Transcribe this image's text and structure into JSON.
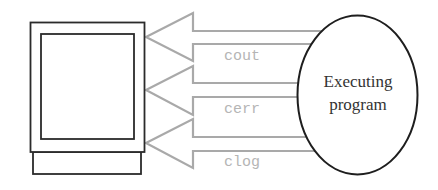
{
  "diagram": {
    "type": "stream-flow",
    "program": {
      "line1": "Executing",
      "line2": "program"
    },
    "display": {
      "label": "monitor"
    },
    "streams": [
      {
        "id": "cout",
        "label": "cout"
      },
      {
        "id": "cerr",
        "label": "cerr"
      },
      {
        "id": "clog",
        "label": "clog"
      }
    ],
    "colors": {
      "arrow": "#a9a9a9",
      "stream_label": "#b5b5b5",
      "outline": "#2b2b2b",
      "program_text": "#333333"
    }
  }
}
